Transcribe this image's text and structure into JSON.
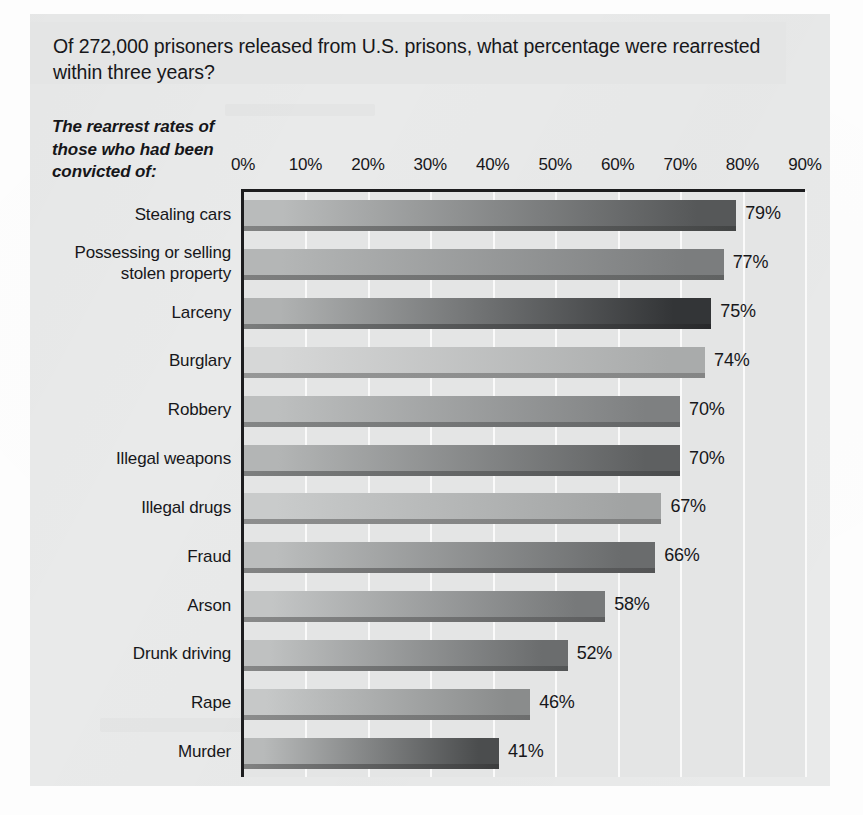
{
  "title": "Of 272,000 prisoners released from U.S. prisons, what percentage were rearrested within three years?",
  "caption": "The rearrest rates of those who had been convicted of:",
  "chart_data": {
    "type": "bar",
    "orientation": "horizontal",
    "title": "Of 272,000 prisoners released from U.S. prisons, what percentage were rearrested within three years?",
    "subtitle": "The rearrest rates of those who had been convicted of:",
    "xlabel": "",
    "ylabel": "",
    "xlim": [
      0,
      90
    ],
    "grid": true,
    "legend": false,
    "value_suffix": "%",
    "tick_labels": [
      "0%",
      "10%",
      "20%",
      "30%",
      "40%",
      "50%",
      "60%",
      "70%",
      "80%",
      "90%"
    ],
    "ticks": [
      0,
      10,
      20,
      30,
      40,
      50,
      60,
      70,
      80,
      90
    ],
    "categories": [
      "Stealing cars",
      "Possessing or selling\nstolen property",
      "Larceny",
      "Burglary",
      "Robbery",
      "Illegal weapons",
      "Illegal drugs",
      "Fraud",
      "Arson",
      "Drunk driving",
      "Rape",
      "Murder"
    ],
    "values": [
      79,
      77,
      75,
      74,
      70,
      70,
      67,
      66,
      58,
      52,
      46,
      41
    ],
    "value_labels": [
      "79%",
      "77%",
      "75%",
      "74%",
      "70%",
      "70%",
      "67%",
      "66%",
      "58%",
      "52%",
      "46%",
      "41%"
    ],
    "bar_colors_light": [
      "#b9bbbb",
      "#b4b6b6",
      "#b0b2b2",
      "#d6d7d7",
      "#bdbfbf",
      "#b3b5b5",
      "#c9cbcb",
      "#bbbdbd",
      "#c3c5c5",
      "#bfc1c1",
      "#c6c8c8",
      "#b8baba"
    ],
    "bar_colors_dark": [
      "#565859",
      "#7b7d7e",
      "#333537",
      "#a9abab",
      "#7e8081",
      "#5e6061",
      "#a1a3a3",
      "#6a6c6d",
      "#77797a",
      "#6b6d6e",
      "#8a8c8c",
      "#4b4d4e"
    ],
    "axis_color": "#1d1d1f",
    "plot_background": "#e4e5e5",
    "gridline_color": "#fafafa"
  }
}
